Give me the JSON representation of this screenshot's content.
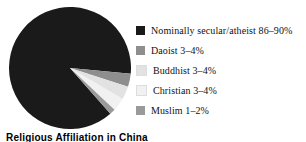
{
  "caption": "Religious Affiliation in China",
  "legend": {
    "position": "right",
    "items": [
      {
        "label": "Nominally secular/atheist 86–90%",
        "color": "#1a1a1a",
        "swatch_name": "legend-swatch-secular"
      },
      {
        "label": "Daoist 3–4%",
        "color": "#8e8e8e",
        "swatch_name": "legend-swatch-daoist"
      },
      {
        "label": "Buddhist 3–4%",
        "color": "#e2e2e2",
        "swatch_name": "legend-swatch-buddhist"
      },
      {
        "label": "Christian 3–4%",
        "color": "#f1f1f1",
        "swatch_name": "legend-swatch-christian"
      },
      {
        "label": "Muslim 1–2%",
        "color": "#9a9a9a",
        "swatch_name": "legend-swatch-muslim"
      }
    ]
  },
  "chart_data": {
    "type": "pie",
    "title": "Religious Affiliation in China",
    "xlabel": "",
    "ylabel": "",
    "categories": [
      "Nominally secular/atheist",
      "Daoist",
      "Buddhist",
      "Christian",
      "Muslim"
    ],
    "values": [
      88,
      3.5,
      3.5,
      3.5,
      1.5
    ],
    "value_labels": [
      "86–90%",
      "3–4%",
      "3–4%",
      "3–4%",
      "1–2%"
    ],
    "colors": [
      "#1a1a1a",
      "#8e8e8e",
      "#e2e2e2",
      "#f1f1f1",
      "#9a9a9a"
    ],
    "units": "percent",
    "legend": true,
    "grid": false,
    "start_angle_deg": 0,
    "direction": "clockwise",
    "slices": [
      {
        "name": "Nominally secular/atheist",
        "value": 88,
        "label": "86–90%",
        "color": "#1a1a1a",
        "start_deg": 48.6,
        "end_deg": 365.4
      },
      {
        "name": "Daoist",
        "value": 3.5,
        "label": "3–4%",
        "color": "#8e8e8e",
        "start_deg": 5.4,
        "end_deg": 18.0
      },
      {
        "name": "Buddhist",
        "value": 3.5,
        "label": "3–4%",
        "color": "#e2e2e2",
        "start_deg": 18.0,
        "end_deg": 30.6
      },
      {
        "name": "Christian",
        "value": 3.5,
        "label": "3–4%",
        "color": "#f1f1f1",
        "start_deg": 30.6,
        "end_deg": 43.2
      },
      {
        "name": "Muslim",
        "value": 1.5,
        "label": "1–2%",
        "color": "#9a9a9a",
        "start_deg": 43.2,
        "end_deg": 48.6
      }
    ],
    "geometry": {
      "cx": 62,
      "cy": 62,
      "r": 61
    }
  }
}
